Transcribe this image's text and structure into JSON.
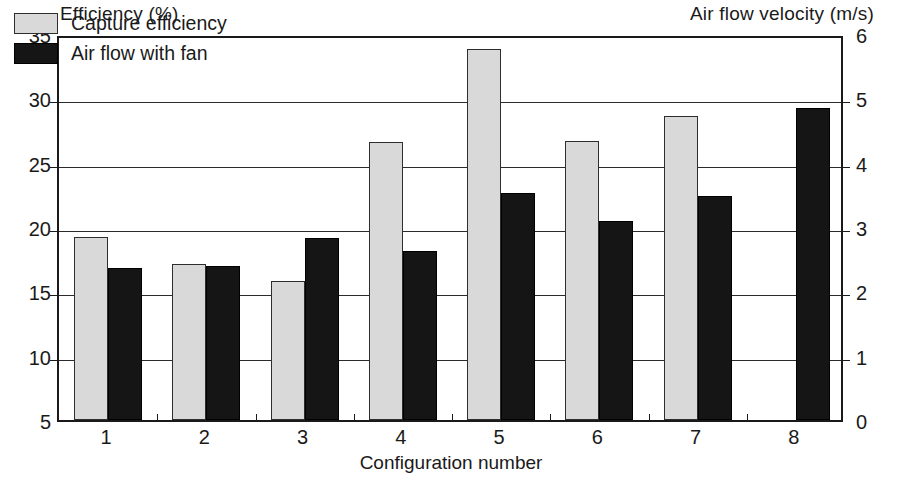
{
  "chart_data": {
    "type": "bar",
    "title": "",
    "categories": [
      "1",
      "2",
      "3",
      "4",
      "5",
      "6",
      "7",
      "8"
    ],
    "xlabel": "Configuration number",
    "ylabel": "Efficiency (%)",
    "y2label": "Air flow velocity (m/s)",
    "ylim": [
      5,
      35
    ],
    "y2lim": [
      0,
      6
    ],
    "yticks": [
      "35",
      "30",
      "25",
      "20",
      "15",
      "10",
      "5"
    ],
    "ytick_values": [
      35,
      30,
      25,
      20,
      15,
      10,
      5
    ],
    "y2ticks": [
      "6",
      "5",
      "4",
      "3",
      "2",
      "1",
      "0"
    ],
    "y2tick_values": [
      6,
      5,
      4,
      3,
      2,
      1,
      0
    ],
    "grid": true,
    "legend_position": "top-left",
    "series": [
      {
        "name": "Capture efficiency",
        "axis": "left",
        "color": "#d9d9d9",
        "values": [
          19.2,
          17.1,
          15.8,
          26.6,
          33.8,
          26.7,
          28.6,
          null
        ]
      },
      {
        "name": "Air flow with fan",
        "axis": "right",
        "color": "#151515",
        "values": [
          2.36,
          2.39,
          2.83,
          2.63,
          3.53,
          3.09,
          3.48,
          4.85
        ]
      }
    ]
  },
  "legend": {
    "items": [
      {
        "label": "Capture efficiency",
        "swatch": "grey"
      },
      {
        "label": "Air flow with fan",
        "swatch": "black"
      }
    ]
  }
}
